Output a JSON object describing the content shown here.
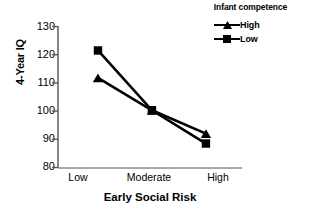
{
  "chart_data": {
    "type": "line",
    "title": "",
    "xlabel": "Early Social Risk",
    "ylabel": "4-Year IQ",
    "categories": [
      "Low",
      "Moderate",
      "High"
    ],
    "ylim": [
      80,
      130
    ],
    "yticks": [
      80,
      90,
      100,
      110,
      120,
      130
    ],
    "ytick_labels": [
      "80",
      "90",
      "100",
      "110",
      "120",
      "130"
    ],
    "grid": false,
    "legend_position": "top-right",
    "legend_title": "Infant competence",
    "series": [
      {
        "name": "High",
        "marker": "triangle",
        "color": "#000000",
        "values": [
          111.8,
          100.3,
          92.0
        ]
      },
      {
        "name": "Low",
        "marker": "square",
        "color": "#000000",
        "values": [
          121.5,
          100.3,
          88.5
        ]
      }
    ]
  },
  "axis": {
    "ylabel": "4-Year IQ",
    "xlabel": "Early Social Risk"
  },
  "legend": {
    "title": "Infant competence",
    "entries": [
      {
        "label": "High",
        "marker": "triangle-marker-icon"
      },
      {
        "label": "Low",
        "marker": "square-marker-icon"
      }
    ]
  },
  "ticks": {
    "y": [
      "130",
      "120",
      "110",
      "100",
      "90",
      "80"
    ],
    "x": [
      "Low",
      "Moderate",
      "High"
    ]
  }
}
